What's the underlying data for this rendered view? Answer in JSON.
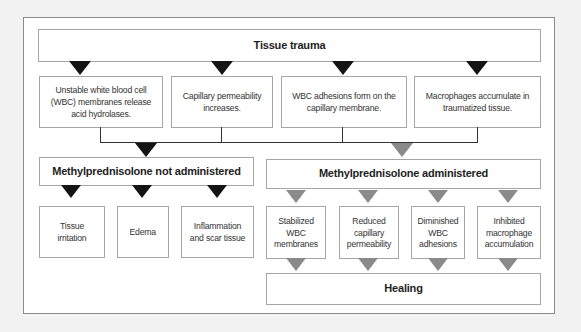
{
  "diagram": {
    "type": "flowchart",
    "colors": {
      "background": "#f2f2f2",
      "frame_border": "#8c8c8c",
      "box_border": "#a6a6a6",
      "arrow_not_administered": "#141414",
      "arrow_administered": "#8a8a8a",
      "text": "#2a2a2a"
    },
    "root": {
      "label": "Tissue trauma"
    },
    "effects": [
      {
        "label": "Unstable white blood cell (WBC) membranes release acid hydrolases."
      },
      {
        "label": "Capillary permeability increases."
      },
      {
        "label": "WBC adhesions form on the capillary membrane."
      },
      {
        "label": "Macrophages accumulate in traumatized tissue."
      }
    ],
    "branches": {
      "not_administered": {
        "label": "Methylprednisolone not administered",
        "outcomes": [
          {
            "label": "Tissue irritation"
          },
          {
            "label": "Edema"
          },
          {
            "label": "Inflammation and scar tissue"
          }
        ]
      },
      "administered": {
        "label": "Methylprednisolone administered",
        "outcomes": [
          {
            "label": "Stabilized WBC membranes"
          },
          {
            "label": "Reduced capillary permeability"
          },
          {
            "label": "Diminished WBC adhesions"
          },
          {
            "label": "Inhibited macrophage accumulation"
          }
        ],
        "result": {
          "label": "Healing"
        }
      }
    }
  }
}
